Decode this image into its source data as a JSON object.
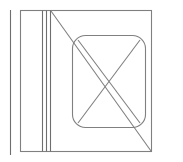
{
  "drawing": {
    "title": "Architectural line drawing",
    "canvas": {
      "width": 183,
      "height": 162,
      "background": "#ffffff"
    },
    "stroke": {
      "color": "#808080",
      "color_dark": "#6e6e6e",
      "width": 1.1
    },
    "elements": {
      "outer_frame": {
        "name": "outer rectangle frame",
        "x": 20.5,
        "y": 10.5,
        "width": 131,
        "height": 141
      },
      "isolated_vertical_line": {
        "name": "leftmost free-standing vertical line",
        "x": 10.5,
        "y1": 10,
        "y2": 155
      },
      "wall_line_a": {
        "name": "inner vertical line a",
        "x": 42.5,
        "y1": 10.5,
        "y2": 151.5
      },
      "wall_line_b": {
        "name": "inner vertical line b",
        "x": 46.5,
        "y1": 10.5,
        "y2": 151.5
      },
      "wall_line_c": {
        "name": "inner vertical line c",
        "x": 50.5,
        "y1": 10.5,
        "y2": 151.5
      },
      "rounded_rect": {
        "name": "central rounded rectangle",
        "x": 72.5,
        "y": 35.5,
        "width": 73,
        "height": 92,
        "radius": 13
      },
      "cross_diagonal_1": {
        "name": "rounded rect diagonal top-left to bottom-right",
        "x1": 78,
        "y1": 40,
        "x2": 140,
        "y2": 123
      },
      "cross_diagonal_2": {
        "name": "rounded rect diagonal bottom-left to top-right",
        "x1": 78,
        "y1": 123,
        "x2": 140,
        "y2": 40
      },
      "long_diagonal": {
        "name": "long diagonal from upper-left junction to lower-right corner",
        "x1": 51,
        "y1": 11,
        "x2": 151,
        "y2": 151
      }
    }
  }
}
